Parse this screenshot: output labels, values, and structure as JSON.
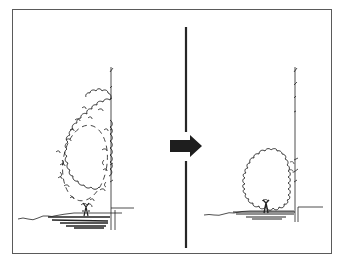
{
  "diagram": {
    "type": "before-after illustration",
    "colors": {
      "background": "#ffffff",
      "frame": "#5a5a5a",
      "line": "#222222",
      "arrow": "#1e1e1e",
      "divider": "#262626"
    },
    "panels": [
      {
        "id": "before",
        "label": "",
        "description": "overgrown shrub with dense bumpy foliage and dashed inner outline marking pruning line"
      },
      {
        "id": "after",
        "label": "",
        "description": "pruned shrub with smooth scalloped outline"
      }
    ],
    "arrow": {
      "direction": "right",
      "icon": "right-arrow-icon"
    }
  }
}
